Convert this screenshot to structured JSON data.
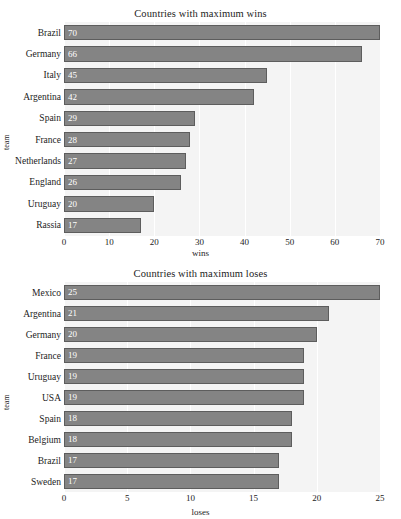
{
  "chart_data": [
    {
      "type": "bar",
      "orientation": "horizontal",
      "title": "Countries with maximum wins",
      "xlabel": "wins",
      "ylabel": "team",
      "categories": [
        "Brazil",
        "Germany",
        "Italy",
        "Argentina",
        "Spain",
        "France",
        "Netherlands",
        "England",
        "Uruguay",
        "Rassia"
      ],
      "values": [
        70,
        66,
        45,
        42,
        29,
        28,
        27,
        26,
        20,
        17
      ],
      "xlim": [
        0,
        70
      ],
      "xticks": [
        0,
        10,
        20,
        30,
        40,
        50,
        60,
        70
      ],
      "xtick_labels": [
        "0",
        "10",
        "20",
        "30",
        "40",
        "50",
        "60",
        "70"
      ],
      "grid": true,
      "legend": "none",
      "bar_color": "#848484",
      "bar_edge_color": "#5d5d5d",
      "value_label_color": "#ffffff",
      "plot_background": "#f4f4f4"
    },
    {
      "type": "bar",
      "orientation": "horizontal",
      "title": "Countries with maximum loses",
      "xlabel": "loses",
      "ylabel": "team",
      "categories": [
        "Mexico",
        "Argentina",
        "Germany",
        "France",
        "Uruguay",
        "USA",
        "Spain",
        "Belgium",
        "Brazil",
        "Sweden"
      ],
      "values": [
        25,
        21,
        20,
        19,
        19,
        19,
        18,
        18,
        17,
        17
      ],
      "xlim": [
        0,
        25
      ],
      "xticks": [
        0,
        5,
        10,
        15,
        20,
        25
      ],
      "xtick_labels": [
        "0",
        "5",
        "10",
        "15",
        "20",
        "25"
      ],
      "grid": true,
      "legend": "none",
      "bar_color": "#848484",
      "bar_edge_color": "#5d5d5d",
      "value_label_color": "#ffffff",
      "plot_background": "#f4f4f4"
    }
  ]
}
